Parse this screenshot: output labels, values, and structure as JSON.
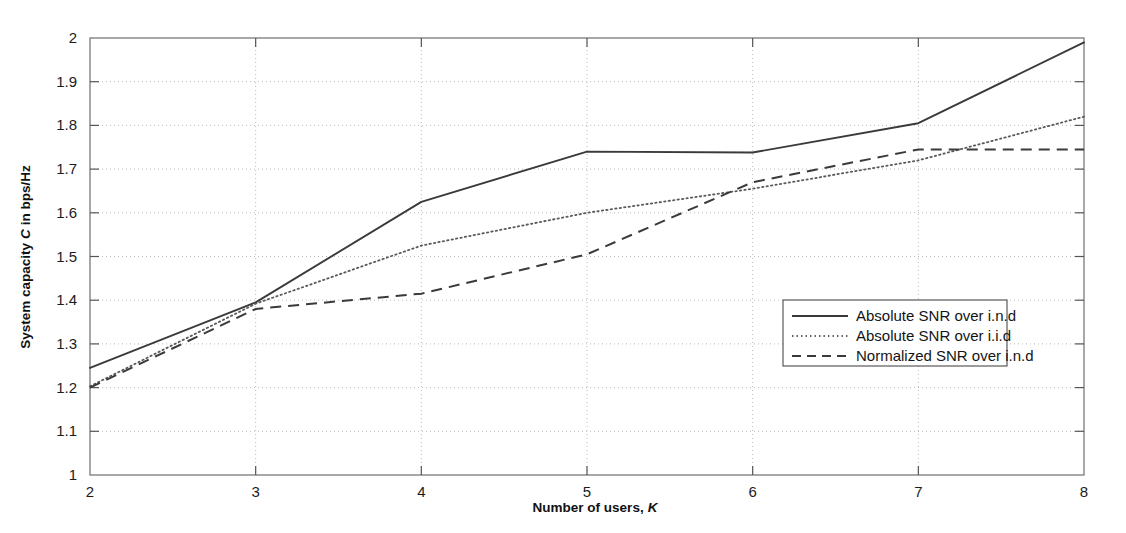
{
  "chart_data": {
    "type": "line",
    "title": "",
    "xlabel": "Number of users, K",
    "xlabel_plain": "Number of users,",
    "xlabel_italic": "K",
    "ylabel": "System capacity C in bps/Hz",
    "ylabel_pre": "System capacity",
    "ylabel_italic": "C",
    "ylabel_post": "in bps/Hz",
    "x": [
      2,
      3,
      4,
      5,
      6,
      7,
      8
    ],
    "xlim": [
      2,
      8
    ],
    "ylim": [
      1,
      2
    ],
    "xticks": [
      "2",
      "3",
      "4",
      "5",
      "6",
      "7",
      "8"
    ],
    "yticks": [
      "1",
      "1.1",
      "1.2",
      "1.3",
      "1.4",
      "1.5",
      "1.6",
      "1.7",
      "1.8",
      "1.9",
      "2"
    ],
    "ytick_values": [
      1,
      1.1,
      1.2,
      1.3,
      1.4,
      1.5,
      1.6,
      1.7,
      1.8,
      1.9,
      2
    ],
    "grid": true,
    "grid_style": "dotted",
    "legend_position": "center-right",
    "series": [
      {
        "name": "Absolute SNR over i.n.d",
        "style": "solid",
        "color": "#3a3a3a",
        "values": [
          1.245,
          1.395,
          1.625,
          1.74,
          1.738,
          1.805,
          1.99
        ]
      },
      {
        "name": "Absolute SNR over i.i.d",
        "style": "dotted",
        "color": "#5a5a5a",
        "values": [
          1.203,
          1.392,
          1.525,
          1.6,
          1.655,
          1.72,
          1.82
        ]
      },
      {
        "name": "Normalized SNR over i.n.d",
        "style": "dashed",
        "color": "#3a3a3a",
        "values": [
          1.2,
          1.38,
          1.415,
          1.505,
          1.67,
          1.745,
          1.745
        ]
      }
    ]
  },
  "legend": {
    "items": [
      {
        "label": "Absolute SNR over i.n.d",
        "style": "solid"
      },
      {
        "label": "Absolute SNR over i.i.d",
        "style": "dotted"
      },
      {
        "label": "Normalized SNR over i.n.d",
        "style": "dashed"
      }
    ]
  }
}
